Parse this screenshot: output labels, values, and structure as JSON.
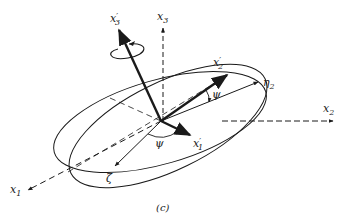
{
  "figure": {
    "caption": "(c)"
  },
  "labels": {
    "x3_prime": {
      "base": "x",
      "prime": "′",
      "sub": "3"
    },
    "x3": {
      "base": "x",
      "sub": "3"
    },
    "x2_prime": {
      "base": "x",
      "prime": "′",
      "sub": "2"
    },
    "eta2": {
      "base": "η",
      "sub": "2"
    },
    "x2": {
      "base": "x",
      "sub": "2"
    },
    "x1_prime": {
      "base": "x",
      "prime": "′",
      "sub": "1"
    },
    "zeta": {
      "base": "ζ"
    },
    "x1": {
      "base": "x",
      "sub": "1"
    },
    "psi_upper": "ψ",
    "psi_lower": "ψ"
  },
  "colors": {
    "ink": "#1a1a1a",
    "background": "#ffffff"
  }
}
